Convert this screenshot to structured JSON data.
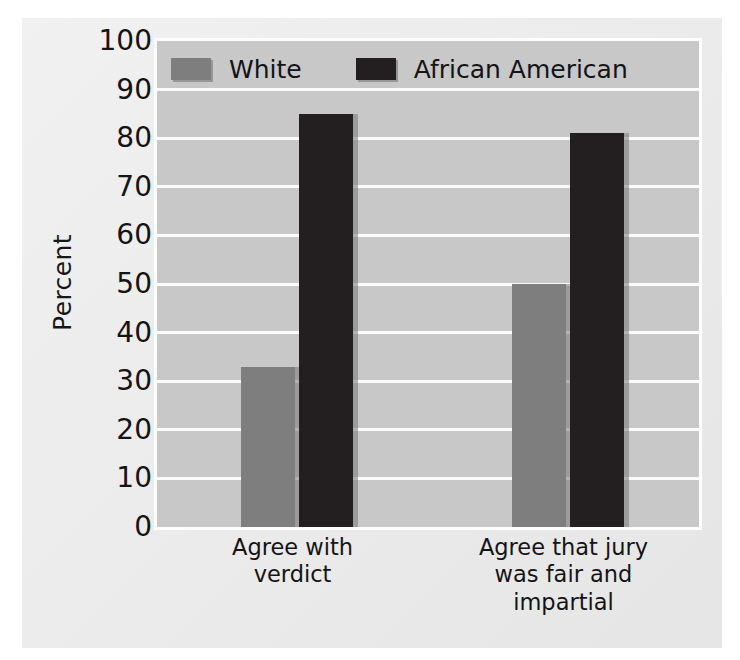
{
  "chart_data": {
    "type": "bar",
    "title": "",
    "xlabel": "",
    "ylabel": "Percent",
    "ylim": [
      0,
      100
    ],
    "ytick_step": 10,
    "yticks": [
      100,
      90,
      80,
      70,
      60,
      50,
      40,
      30,
      20,
      10,
      0
    ],
    "grid": true,
    "legend_position": "top-left inside plot",
    "categories": [
      "Agree with verdict",
      "Agree that jury was fair and impartial"
    ],
    "category_lines": [
      [
        "Agree with",
        "verdict"
      ],
      [
        "Agree that jury",
        "was fair and",
        "impartial"
      ]
    ],
    "series": [
      {
        "name": "White",
        "color": "#7e7e7e",
        "values": [
          33,
          50
        ]
      },
      {
        "name": "African American",
        "color": "#231f20",
        "values": [
          85,
          81
        ]
      }
    ]
  },
  "style": {
    "page_background": "#ffffff",
    "sheet_background": "#e9e9e9",
    "plot_background": "#c8c8c8",
    "gridline_color": "#fbfbfb",
    "plot_border_color": "#fdfdfd",
    "text_color": "#141416"
  }
}
